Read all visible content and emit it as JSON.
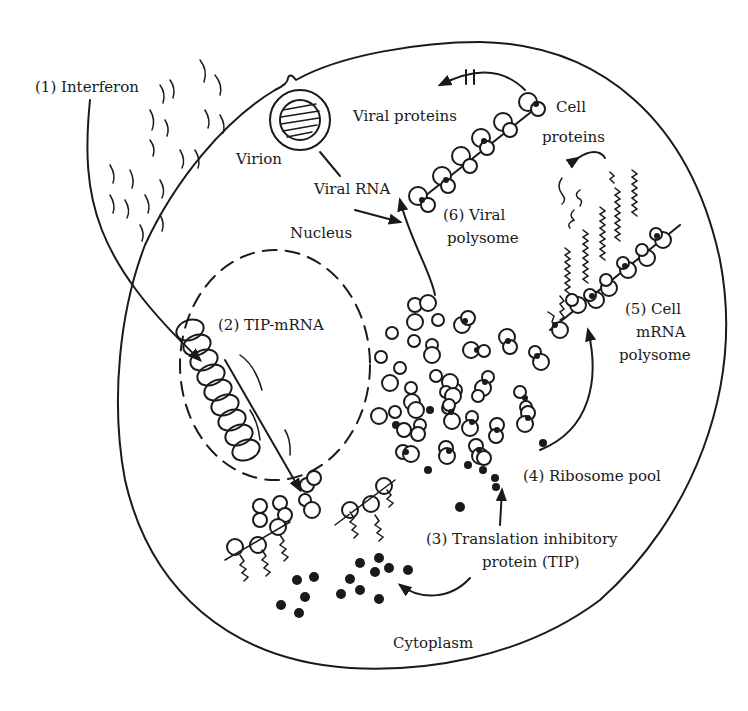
{
  "diagram": {
    "labels": {
      "interferon": "(1) Interferon",
      "virion": "Virion",
      "viral_proteins": "Viral proteins",
      "cell_proteins_line1": "Cell",
      "cell_proteins_line2": "proteins",
      "viral_rna": "Viral RNA",
      "viral_polysome_line1": "(6)   Viral",
      "viral_polysome_line2": "polysome",
      "nucleus": "Nucleus",
      "tip_mrna": "(2) TIP-mRNA",
      "cell_mrna_polysome_line1": "(5) Cell",
      "cell_mrna_polysome_line2": "mRNA",
      "cell_mrna_polysome_line3": "polysome",
      "ribosome_pool": "(4) Ribosome pool",
      "tip_line1": "(3) Translation inhibitory",
      "tip_line2": "protein (TIP)",
      "cytoplasm": "Cytoplasm"
    },
    "colors": {
      "ink": "#1a1a1a",
      "background": "#ffffff"
    }
  }
}
